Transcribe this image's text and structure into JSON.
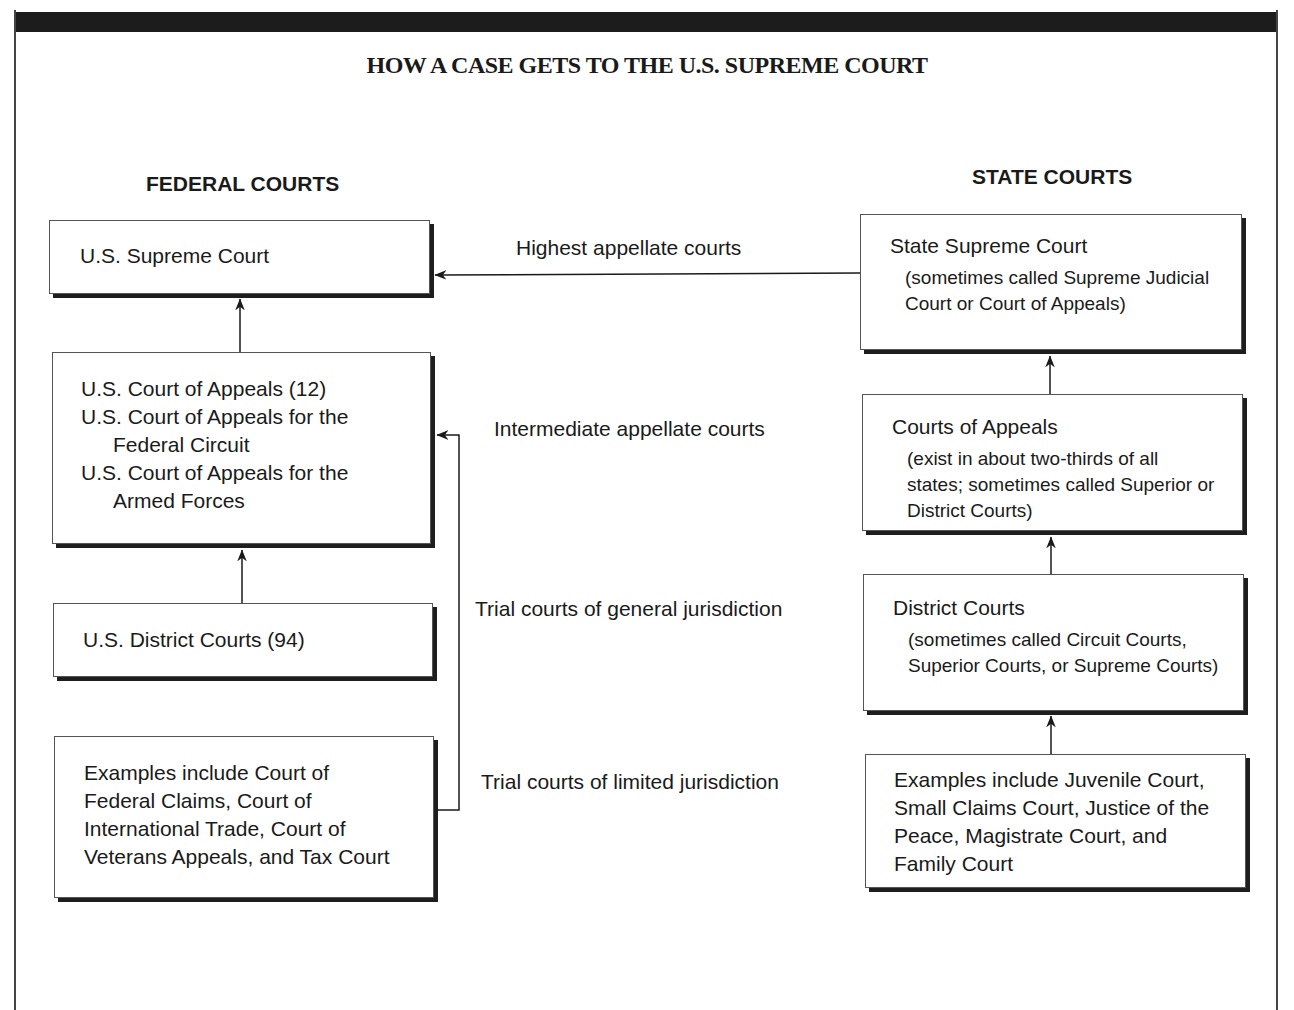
{
  "title": "HOW A CASE GETS TO THE U.S. SUPREME COURT",
  "federal": {
    "heading": "FEDERAL COURTS",
    "boxes": [
      {
        "lines": [
          "U.S. Supreme Court"
        ]
      },
      {
        "lines": [
          "U.S. Court of Appeals (12)",
          "U.S. Court of Appeals for the",
          "Federal Circuit",
          "U.S. Court of Appeals for the",
          "Armed Forces"
        ]
      },
      {
        "lines": [
          "U.S. District Courts (94)"
        ]
      },
      {
        "lines": [
          "Examples include Court of",
          "Federal Claims, Court of",
          "International Trade, Court of",
          "Veterans Appeals, and Tax Court"
        ]
      }
    ]
  },
  "state": {
    "heading": "STATE COURTS",
    "boxes": [
      {
        "title": "State Supreme Court",
        "lines": [
          "(sometimes called Supreme Judicial",
          "Court or Court of Appeals)"
        ]
      },
      {
        "title": "Courts of Appeals",
        "lines": [
          "(exist in about two-thirds of all",
          "states; sometimes called Superior or",
          "District Courts)"
        ]
      },
      {
        "title": "District Courts",
        "lines": [
          "(sometimes called Circuit Courts,",
          "Superior Courts, or Supreme Courts)"
        ]
      },
      {
        "lines": [
          "Examples include Juvenile Court,",
          "Small Claims Court, Justice of the",
          "Peace, Magistrate Court, and",
          "Family Court"
        ]
      }
    ]
  },
  "levels": [
    "Highest appellate courts",
    "Intermediate appellate courts",
    "Trial courts of general jurisdiction",
    "Trial courts of limited jurisdiction"
  ],
  "colors": {
    "ink": "#1a1a1a",
    "border": "#555555",
    "shadow": "#1e1e1e",
    "bar": "#1c1c1c"
  }
}
